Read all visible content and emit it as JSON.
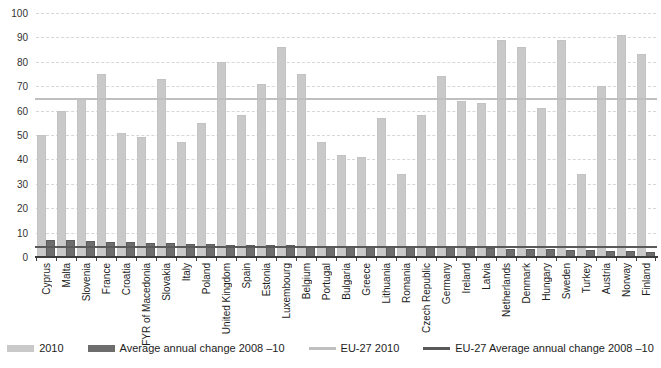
{
  "chart_data": {
    "type": "bar",
    "title": "",
    "xlabel": "",
    "ylabel": "",
    "ylim": [
      0,
      100
    ],
    "ytick_step": 10,
    "yticks": [
      0,
      10,
      20,
      30,
      40,
      50,
      60,
      70,
      80,
      90,
      100
    ],
    "grid": "dashed-horizontal",
    "legend_position": "bottom",
    "categories": [
      "Cyprus",
      "Malta",
      "Slovenia",
      "France",
      "Croatia",
      "FYR of Macedonia",
      "Slovakia",
      "Italy",
      "Poland",
      "United Kingdom",
      "Spain",
      "Estonia",
      "Luxembourg",
      "Belgium",
      "Portugal",
      "Bulgaria",
      "Greece",
      "Lithuania",
      "Romania",
      "Czech Republic",
      "Germany",
      "Ireland",
      "Latvia",
      "Netherlands",
      "Denmark",
      "Hungary",
      "Sweden",
      "Turkey",
      "Austria",
      "Norway",
      "Finland"
    ],
    "series": [
      {
        "name": "2010",
        "color": "#c9c9c9",
        "values": [
          50,
          60,
          65,
          75,
          51,
          49,
          73,
          47,
          55,
          80,
          58,
          71,
          86,
          75,
          47,
          42,
          41,
          57,
          34,
          58,
          74,
          64,
          63,
          89,
          86,
          61,
          89,
          34,
          70,
          91,
          83
        ]
      },
      {
        "name": "Average annual change 2008 –10",
        "color": "#6d6d6d",
        "values": [
          7.0,
          6.8,
          6.5,
          6.3,
          6.1,
          5.9,
          5.7,
          5.5,
          5.3,
          5.1,
          5.0,
          4.9,
          4.8,
          4.7,
          4.6,
          4.5,
          4.4,
          4.3,
          4.2,
          4.1,
          4.0,
          3.8,
          3.6,
          3.4,
          3.3,
          3.2,
          3.0,
          2.8,
          2.6,
          2.4,
          2.2
        ]
      }
    ],
    "reference_lines": [
      {
        "name": "EU-27 2010",
        "value": 64.6,
        "color": "#bfbfbf"
      },
      {
        "name": "EU-27 Average annual change 2008 –10",
        "value": 4.0,
        "color": "#595959"
      }
    ]
  },
  "legend": {
    "items": [
      {
        "label": "2010",
        "type": "bar",
        "color": "#c9c9c9"
      },
      {
        "label": "Average annual change 2008 –10",
        "type": "bar",
        "color": "#6d6d6d"
      },
      {
        "label": "EU-27 2010",
        "type": "line",
        "color": "#bfbfbf"
      },
      {
        "label": "EU-27 Average annual change 2008 –10",
        "type": "line",
        "color": "#595959"
      }
    ]
  },
  "colors": {
    "axis": "#3c3c3c",
    "grid": "#d7d7d7",
    "text": "#1d1d1d"
  }
}
